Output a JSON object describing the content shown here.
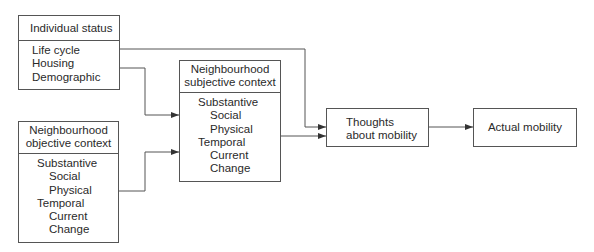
{
  "diagram": {
    "nodes": {
      "individual_status": {
        "title": "Individual status",
        "items": [
          "Life cycle",
          "Housing",
          "Demographic"
        ]
      },
      "objective_context": {
        "title_line1": "Neighbourhood",
        "title_line2": "objective context",
        "items": [
          "Substantive",
          "Social",
          "Physical",
          "Temporal",
          "Current",
          "Change"
        ]
      },
      "subjective_context": {
        "title_line1": "Neighbourhood",
        "title_line2": "subjective context",
        "items": [
          "Substantive",
          "Social",
          "Physical",
          "Temporal",
          "Current",
          "Change"
        ]
      },
      "thoughts": {
        "line1": "Thoughts",
        "line2": "about mobility"
      },
      "actual_mobility": {
        "label": "Actual mobility"
      }
    },
    "edges": [
      {
        "from": "individual_status",
        "to": "thoughts"
      },
      {
        "from": "individual_status",
        "to": "subjective_context"
      },
      {
        "from": "objective_context",
        "to": "subjective_context"
      },
      {
        "from": "subjective_context",
        "to": "thoughts"
      },
      {
        "from": "thoughts",
        "to": "actual_mobility"
      }
    ],
    "line_color": "#444444"
  }
}
